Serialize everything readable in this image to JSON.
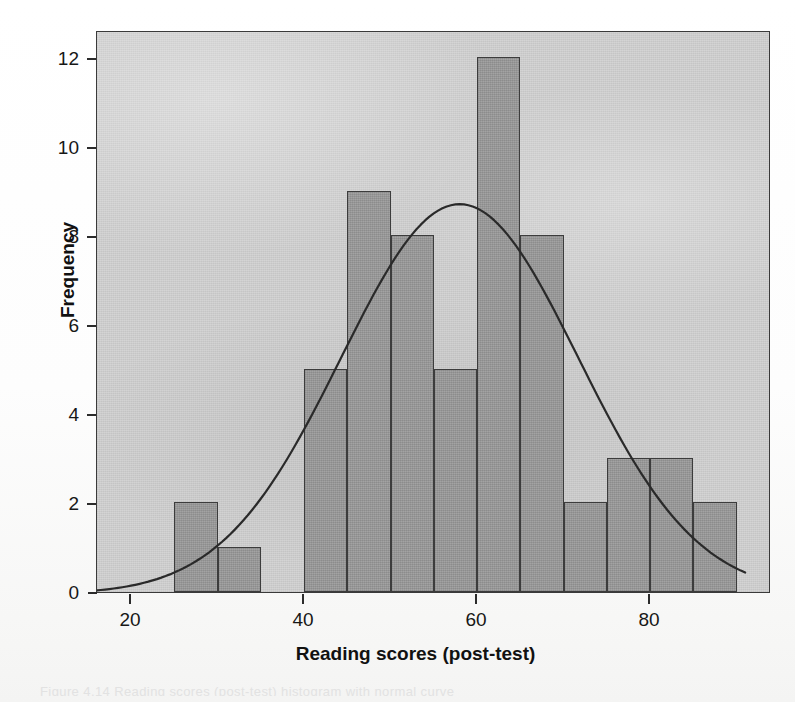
{
  "chart_data": {
    "type": "bar",
    "title": "",
    "subtitle": "",
    "xlabel": "Reading scores (post-test)",
    "ylabel": "Frequency",
    "xlim": [
      16,
      91
    ],
    "ylim": [
      0,
      12.65
    ],
    "xticks": [
      20,
      40,
      60,
      80
    ],
    "yticks": [
      0,
      2,
      4,
      6,
      8,
      10,
      12
    ],
    "xtick_labels": [
      "20",
      "40",
      "60",
      "80"
    ],
    "ytick_labels": [
      "0",
      "2",
      "4",
      "6",
      "8",
      "10",
      "12"
    ],
    "grid": false,
    "legend": "none",
    "bin_width": 5,
    "bin_starts": [
      25,
      30,
      35,
      40,
      45,
      50,
      55,
      60,
      65,
      70,
      75,
      80,
      85
    ],
    "categories": [
      "25-30",
      "30-35",
      "35-40",
      "40-45",
      "45-50",
      "50-55",
      "55-60",
      "60-65",
      "65-70",
      "70-75",
      "75-80",
      "80-85",
      "85-90"
    ],
    "values": [
      2,
      1,
      0,
      5,
      9,
      8,
      5,
      12,
      8,
      2,
      3,
      3,
      2
    ],
    "n_total": 60,
    "overlay": {
      "type": "line",
      "name": "normal curve",
      "mean": 58,
      "sd": 13.7,
      "peak_value": 8.76,
      "peak_x": 58
    },
    "colors": {
      "bar_fill": "#9a9a9a",
      "bar_edge": "#3c3c3c",
      "panel_background": "#d2d2d2",
      "curve": "#2a2a2a",
      "axis": "#2b2b2b",
      "text": "#171717"
    }
  },
  "figure": {
    "x_axis_title": "Reading scores (post-test)",
    "y_axis_title": "Frequency",
    "caption_ghost": "Figure 4.14 Reading scores (post-test) histogram with normal curve"
  }
}
